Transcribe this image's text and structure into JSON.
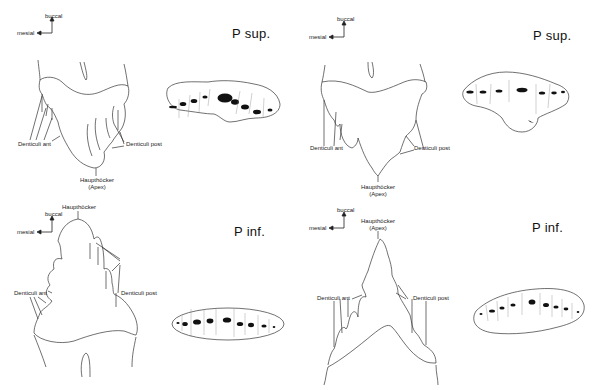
{
  "figure": {
    "panels": [
      {
        "id": "upper-left",
        "title": "P sup.",
        "orientation": {
          "up_label": "buccal",
          "left_label": "mesial"
        },
        "labels": {
          "denticuli_ant": "Denticuli ant",
          "denticuli_post": "Denticuli post",
          "haupthoecker": "Haupthöcker",
          "apex": "(Apex)"
        }
      },
      {
        "id": "upper-right",
        "title": "P sup.",
        "orientation": {
          "up_label": "buccal",
          "left_label": "mesial"
        },
        "labels": {
          "denticuli_ant": "Denticuli ant",
          "denticuli_post": "Denticuli post",
          "haupthoecker": "Haupthöcker",
          "apex": "(Apex)"
        }
      },
      {
        "id": "lower-left",
        "title": "P inf.",
        "orientation": {
          "up_label": "buccal",
          "left_label": "mesial"
        },
        "labels": {
          "denticuli_ant": "Denticuli ant",
          "denticuli_post": "Denticuli post",
          "haupthoecker": "Haupthöcker"
        }
      },
      {
        "id": "lower-right",
        "title": "P inf.",
        "orientation": {
          "up_label": "buccal",
          "left_label": "mesial"
        },
        "labels": {
          "denticuli_ant": "Denticuli ant",
          "denticuli_post": "Denticuli post",
          "haupthoecker": "Haupthöcker",
          "apex": "(Apex)"
        }
      }
    ]
  }
}
